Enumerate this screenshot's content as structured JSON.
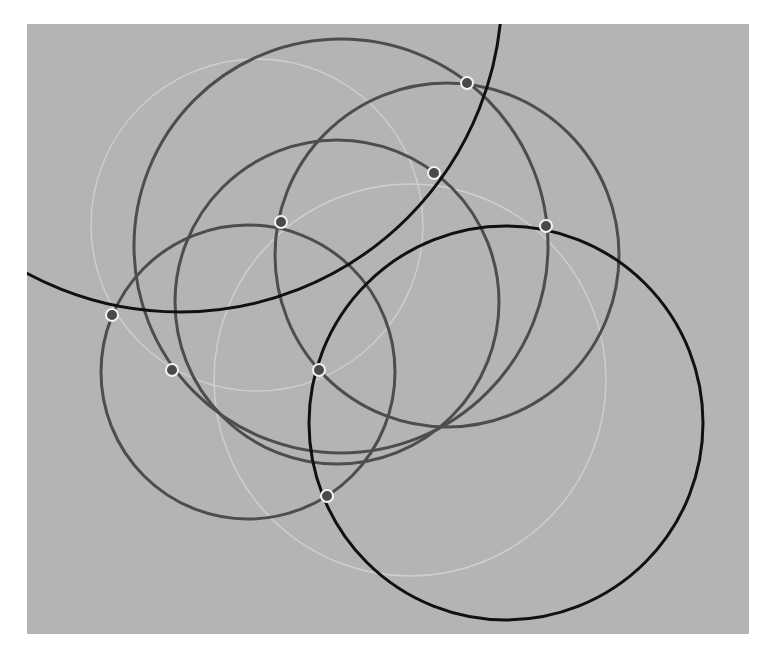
{
  "diagram": {
    "canvas": {
      "x": 27,
      "y": 24,
      "width": 722,
      "height": 610,
      "fill": "#b4b4b4"
    },
    "colors": {
      "background": "#ffffff",
      "canvas": "#b4b4b4",
      "black_circle": "#111111",
      "gray_circle": "#4d4d4d",
      "light_circle": "#cfcfcf",
      "point_fill": "#4a4a4a",
      "point_ring": "#f2f2f2"
    },
    "circles": [
      {
        "id": "light-1",
        "kind": "light",
        "cx": 257,
        "cy": 225,
        "r": 166
      },
      {
        "id": "light-2",
        "kind": "light",
        "cx": 410,
        "cy": 380,
        "r": 196
      },
      {
        "id": "gray-a",
        "kind": "gray",
        "cx": 341,
        "cy": 246,
        "r": 207
      },
      {
        "id": "gray-b",
        "kind": "gray",
        "cx": 447,
        "cy": 255,
        "r": 172
      },
      {
        "id": "gray-c",
        "kind": "gray",
        "cx": 337,
        "cy": 302,
        "r": 162
      },
      {
        "id": "gray-d",
        "kind": "gray",
        "cx": 248,
        "cy": 372,
        "r": 147
      },
      {
        "id": "black-1",
        "kind": "black",
        "cx": 180,
        "cy": -10,
        "r": 322
      },
      {
        "id": "black-2",
        "kind": "black",
        "cx": 506,
        "cy": 423,
        "r": 197
      }
    ],
    "points": [
      {
        "id": "p1",
        "x": 467,
        "y": 83
      },
      {
        "id": "p2",
        "x": 434,
        "y": 173
      },
      {
        "id": "p3",
        "x": 281,
        "y": 222
      },
      {
        "id": "p4",
        "x": 546,
        "y": 226
      },
      {
        "id": "p5",
        "x": 112,
        "y": 315
      },
      {
        "id": "p6",
        "x": 172,
        "y": 370
      },
      {
        "id": "p7",
        "x": 319,
        "y": 370
      },
      {
        "id": "p8",
        "x": 327,
        "y": 496
      }
    ]
  }
}
